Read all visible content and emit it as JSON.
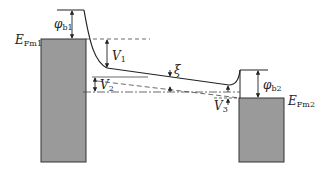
{
  "diagram": {
    "type": "energy-band-diagram",
    "colors": {
      "metal_fill": "#9a9a9a",
      "line": "#222222",
      "background": "#ffffff"
    },
    "labels": {
      "phi_b1": {
        "main": "φ",
        "sub": "b1"
      },
      "phi_b2": {
        "main": "φ",
        "sub": "b2"
      },
      "efm1": {
        "main": "E",
        "sub": "Fm1"
      },
      "efm2": {
        "main": "E",
        "sub": "Fm2"
      },
      "v1": {
        "main": "V",
        "sub": "1"
      },
      "v2": {
        "main": "V",
        "sub": "2"
      },
      "v3": {
        "main": "V",
        "sub": "3"
      },
      "xi": {
        "main": "ξ"
      }
    }
  }
}
